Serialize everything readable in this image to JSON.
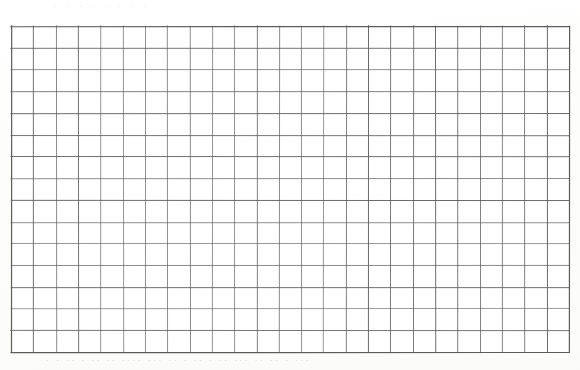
{
  "document": {
    "kind": "scanned-worksheet",
    "title": "Blank graph paper grid",
    "media": "photocopied paper sheet"
  },
  "canvas": {
    "width": 580,
    "height": 370,
    "background_color": "#fdfdfc"
  },
  "grid": {
    "columns": 25,
    "rows": 15,
    "origin_x": 11,
    "origin_y": 26,
    "width": 558,
    "height": 326,
    "cell_width": 22.32,
    "cell_height": 21.73,
    "line_color": "#5a5a5a",
    "line_width": 1,
    "border_color": "#4e4e4e",
    "border_width": 1.2,
    "fill_color": "#ffffff",
    "has_labels": false,
    "has_data": false,
    "is_empty": true
  },
  "artifacts": {
    "ghost_top_text": "· ·    ·     ·    ·   ·   ·  ·",
    "ghost_bottom_text": "· · ·· · ·· ·· ···· ··· ·· · ·· · ·· ···   ·· ··    · ···",
    "ghost_mid_text": "·  ·   ··  ·   ·  ·· ·   ·",
    "ghost_color": "#dcdcd9",
    "description": "faint bleed-through marks from the reverse side of the scanned page"
  },
  "chart_data": {
    "type": "table",
    "title": "",
    "subtitle": "",
    "xlabel": "",
    "ylabel": "",
    "categories": [],
    "values": [],
    "series": [],
    "grid": true,
    "legend": false,
    "legend_position": "none",
    "xlim": [
      0,
      25
    ],
    "ylim": [
      0,
      15
    ],
    "x_tick_labels": [],
    "y_tick_labels": [],
    "annotations": [],
    "note": "Empty 25-column by 15-row graph-paper grid; no plotted data, axes labels, or tick values are present in the image."
  }
}
